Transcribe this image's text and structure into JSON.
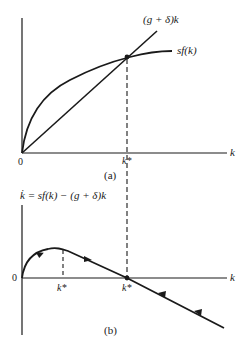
{
  "panel_a": {
    "caption": "(a)",
    "origin_label": "0",
    "x_axis_label": "k",
    "kstar_label": "k*",
    "line_label": "(g + δ)k",
    "curve_label": "sf(k)"
  },
  "panel_b": {
    "caption": "(b)",
    "origin_label": "0",
    "x_axis_label": "k",
    "y_axis_label": "k̇ = sf(k) − (g + δ)k",
    "kstar_left_label": "k*",
    "kstar_right_label": "k*"
  },
  "colors": {
    "ink": "#1a1a1a",
    "background": "#ffffff"
  }
}
